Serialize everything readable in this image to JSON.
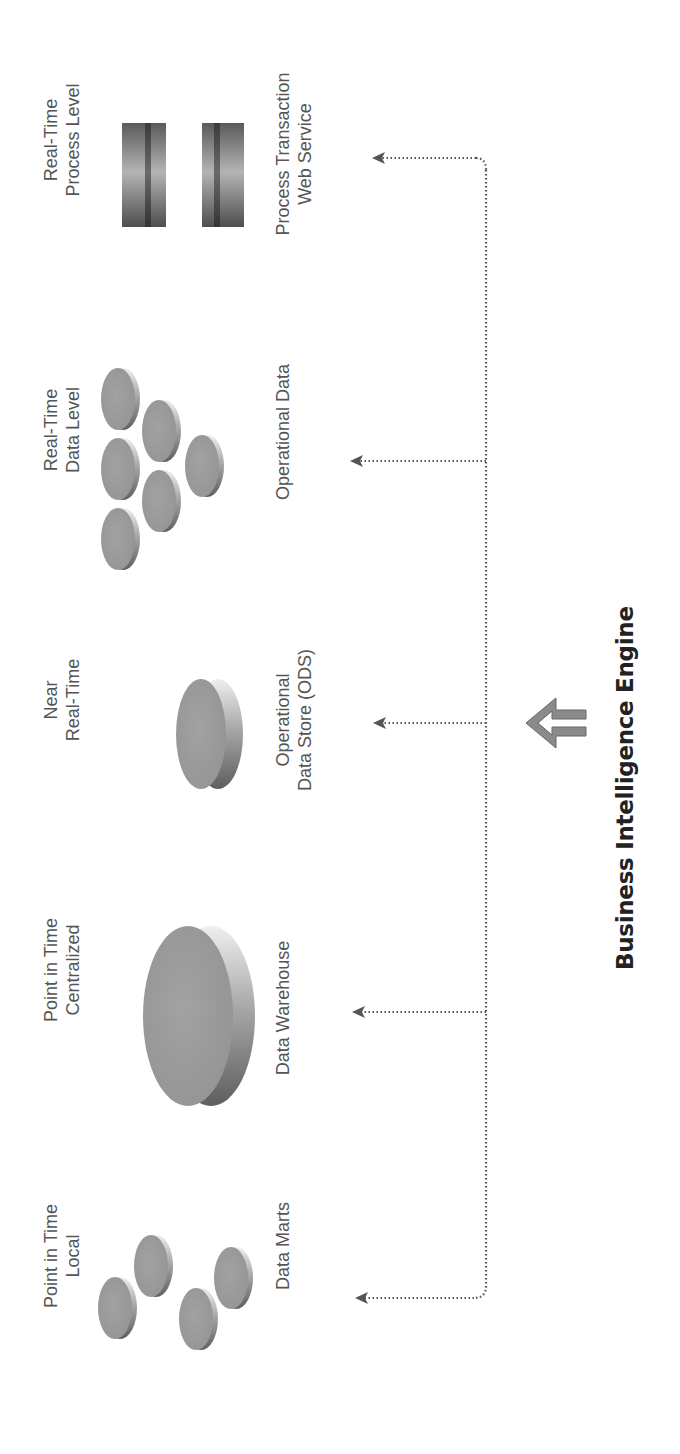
{
  "diagram": {
    "title": "Business Intelligence Engine",
    "colors": {
      "label_text": "#555555",
      "title_text": "#222222",
      "disk_face": "#9a9a9a",
      "disk_side_dark": "#6a6a6a",
      "disk_side_light": "#e8e8e8",
      "connector": "#555555",
      "big_arrow": "#6a6a6a"
    },
    "columns": [
      {
        "id": "data-marts",
        "top_label": [
          "Point in Time",
          "Local"
        ],
        "bottom_label": [
          "Data Marts"
        ],
        "icon": "four-small-disks-icon"
      },
      {
        "id": "data-warehouse",
        "top_label": [
          "Point in Time",
          "Centralized"
        ],
        "bottom_label": [
          "Data Warehouse"
        ],
        "icon": "large-disk-icon"
      },
      {
        "id": "ods",
        "top_label": [
          "Near",
          "Real-Time"
        ],
        "bottom_label": [
          "Operational",
          "Data Store (ODS)"
        ],
        "icon": "medium-disk-icon"
      },
      {
        "id": "operational-data",
        "top_label": [
          "Real-Time",
          "Data Level"
        ],
        "bottom_label": [
          "Operational Data"
        ],
        "icon": "six-small-disks-icon"
      },
      {
        "id": "process-transaction",
        "top_label": [
          "Real-Time",
          "Process Level"
        ],
        "bottom_label": [
          "Process Transaction",
          "Web Service"
        ],
        "icon": "two-gradient-bars-icon"
      }
    ],
    "connector": {
      "style": "dotted",
      "arrow_targets": [
        "Data Marts",
        "Data Warehouse",
        "Operational Data Store (ODS)",
        "Operational Data",
        "Process Transaction Web Service"
      ]
    },
    "engine_arrow_icon": "hollow-up-arrow-icon"
  }
}
